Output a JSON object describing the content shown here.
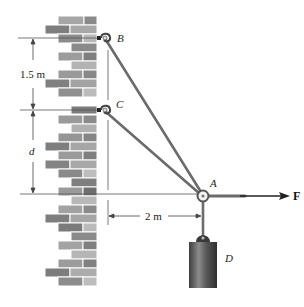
{
  "figure": {
    "points": {
      "A": "A",
      "B": "B",
      "C": "C",
      "D": "D"
    },
    "force_label": "F",
    "dimensions": {
      "vertical_BC": "1.5 m",
      "vertical_CA": "d",
      "horizontal_wall_A": "2 m"
    },
    "colors": {
      "cable": "#6b6b6b",
      "brick_dark": "#7d7d7d",
      "brick_mid": "#9a9a9a",
      "brick_light": "#bdbdbd",
      "weight": "#555555",
      "dimension_line": "#444444"
    }
  }
}
